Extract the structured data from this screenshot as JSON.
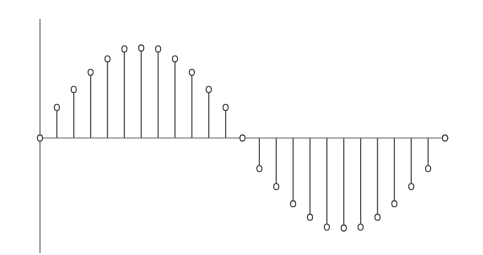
{
  "chart_data": {
    "type": "stem",
    "title": "",
    "xlabel": "",
    "ylabel": "",
    "grid": false,
    "legend": "none",
    "x": [
      0,
      1,
      2,
      3,
      4,
      5,
      6,
      7,
      8,
      9,
      10,
      11,
      12,
      13,
      14,
      15,
      16,
      17,
      18,
      19,
      20,
      21,
      22,
      23,
      24
    ],
    "values": [
      0,
      0.34,
      0.54,
      0.73,
      0.88,
      0.99,
      1.0,
      0.99,
      0.88,
      0.73,
      0.54,
      0.34,
      0,
      -0.34,
      -0.54,
      -0.73,
      -0.88,
      -0.99,
      -1.0,
      -0.99,
      -0.88,
      -0.73,
      -0.54,
      -0.34,
      0
    ],
    "xlim": [
      0,
      24.3
    ],
    "ylim": [
      -1.3,
      1.33
    ],
    "marker": "open-circle"
  }
}
